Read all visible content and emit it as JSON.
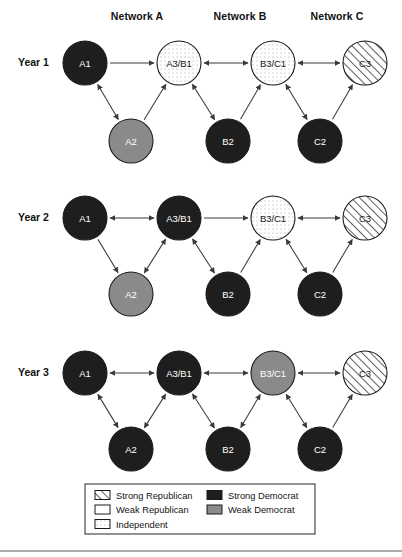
{
  "figure": {
    "network_labels": [
      {
        "text": "Network A",
        "x": 137,
        "y": 17
      },
      {
        "text": "Network B",
        "x": 240,
        "y": 17
      },
      {
        "text": "Network C",
        "x": 337,
        "y": 17
      }
    ],
    "year_labels": [
      {
        "text": "Year 1",
        "x": 18,
        "y": 63
      },
      {
        "text": "Year 2",
        "x": 18,
        "y": 218
      },
      {
        "text": "Year 3",
        "x": 18,
        "y": 373
      }
    ]
  },
  "legend": {
    "title": "",
    "box": {
      "x": 85,
      "y": 484,
      "width": 230,
      "height": 50
    },
    "items": [
      {
        "label": "Strong Republican",
        "fill": "hatch",
        "column": 0,
        "row": 0
      },
      {
        "label": "Weak Republican",
        "fill": "white",
        "column": 0,
        "row": 1
      },
      {
        "label": "Independent",
        "fill": "dotted",
        "column": 0,
        "row": 2
      },
      {
        "label": "Strong Democrat",
        "fill": "black",
        "column": 1,
        "row": 0
      },
      {
        "label": "Weak Democrat",
        "fill": "gray",
        "column": 1,
        "row": 1
      }
    ]
  },
  "colors": {
    "strong_democrat": "#1e1e1e",
    "weak_democrat": "#8a8a8a",
    "independent": "#ffffff",
    "weak_republican": "#ffffff",
    "strong_republican": "#ffffff",
    "edge": "#3a3a3a",
    "text": "#141414",
    "background": "#ffffff"
  },
  "chart_data": {
    "type": "diagram",
    "title": "",
    "rows": [
      {
        "year": "Year 1",
        "nodes": [
          {
            "id": "A1",
            "label": "A1",
            "x": 85,
            "y": 63,
            "r": 22,
            "state": "strong_democrat"
          },
          {
            "id": "A3/B1",
            "label": "A3/B1",
            "x": 179,
            "y": 63,
            "r": 22,
            "state": "independent"
          },
          {
            "id": "B3/C1",
            "label": "B3/C1",
            "x": 273,
            "y": 63,
            "r": 22,
            "state": "independent"
          },
          {
            "id": "C3",
            "label": "C3",
            "x": 365,
            "y": 63,
            "r": 22,
            "state": "strong_republican"
          },
          {
            "id": "A2",
            "label": "A2",
            "x": 131,
            "y": 141,
            "r": 22,
            "state": "weak_democrat"
          },
          {
            "id": "B2",
            "label": "B2",
            "x": 228,
            "y": 141,
            "r": 22,
            "state": "strong_democrat"
          },
          {
            "id": "C2",
            "label": "C2",
            "x": 320,
            "y": 141,
            "r": 22,
            "state": "strong_democrat"
          }
        ],
        "edges": [
          {
            "from": "A1",
            "to": "A3/B1",
            "dir": "forward"
          },
          {
            "from": "A3/B1",
            "to": "B3/C1",
            "dir": "both"
          },
          {
            "from": "B3/C1",
            "to": "C3",
            "dir": "both"
          },
          {
            "from": "A1",
            "to": "A2",
            "dir": "both"
          },
          {
            "from": "A2",
            "to": "A3/B1",
            "dir": "forward"
          },
          {
            "from": "A3/B1",
            "to": "B2",
            "dir": "both"
          },
          {
            "from": "B2",
            "to": "B3/C1",
            "dir": "forward"
          },
          {
            "from": "B3/C1",
            "to": "C2",
            "dir": "both"
          },
          {
            "from": "C2",
            "to": "C3",
            "dir": "forward"
          }
        ]
      },
      {
        "year": "Year 2",
        "nodes": [
          {
            "id": "A1",
            "label": "A1",
            "x": 85,
            "y": 218,
            "r": 22,
            "state": "strong_democrat"
          },
          {
            "id": "A3/B1",
            "label": "A3/B1",
            "x": 179,
            "y": 218,
            "r": 22,
            "state": "strong_democrat"
          },
          {
            "id": "B3/C1",
            "label": "B3/C1",
            "x": 273,
            "y": 218,
            "r": 22,
            "state": "independent"
          },
          {
            "id": "C3",
            "label": "C3",
            "x": 365,
            "y": 218,
            "r": 22,
            "state": "strong_republican"
          },
          {
            "id": "A2",
            "label": "A2",
            "x": 131,
            "y": 294,
            "r": 22,
            "state": "weak_democrat"
          },
          {
            "id": "B2",
            "label": "B2",
            "x": 228,
            "y": 294,
            "r": 22,
            "state": "strong_democrat"
          },
          {
            "id": "C2",
            "label": "C2",
            "x": 320,
            "y": 294,
            "r": 22,
            "state": "strong_democrat"
          }
        ],
        "edges": [
          {
            "from": "A1",
            "to": "A3/B1",
            "dir": "both"
          },
          {
            "from": "A3/B1",
            "to": "B3/C1",
            "dir": "forward"
          },
          {
            "from": "B3/C1",
            "to": "C3",
            "dir": "both"
          },
          {
            "from": "A1",
            "to": "A2",
            "dir": "forward"
          },
          {
            "from": "A3/B1",
            "to": "A2",
            "dir": "both"
          },
          {
            "from": "B2",
            "to": "A3/B1",
            "dir": "both"
          },
          {
            "from": "B2",
            "to": "B3/C1",
            "dir": "forward"
          },
          {
            "from": "B3/C1",
            "to": "C2",
            "dir": "both"
          },
          {
            "from": "C2",
            "to": "C3",
            "dir": "forward"
          }
        ]
      },
      {
        "year": "Year 3",
        "nodes": [
          {
            "id": "A1",
            "label": "A1",
            "x": 85,
            "y": 373,
            "r": 22,
            "state": "strong_democrat"
          },
          {
            "id": "A3/B1",
            "label": "A3/B1",
            "x": 179,
            "y": 373,
            "r": 22,
            "state": "strong_democrat"
          },
          {
            "id": "B3/C1",
            "label": "B3/C1",
            "x": 273,
            "y": 373,
            "r": 22,
            "state": "weak_democrat"
          },
          {
            "id": "C3",
            "label": "C3",
            "x": 365,
            "y": 373,
            "r": 22,
            "state": "strong_republican"
          },
          {
            "id": "A2",
            "label": "A2",
            "x": 131,
            "y": 449,
            "r": 22,
            "state": "strong_democrat"
          },
          {
            "id": "B2",
            "label": "B2",
            "x": 228,
            "y": 449,
            "r": 22,
            "state": "strong_democrat"
          },
          {
            "id": "C2",
            "label": "C2",
            "x": 320,
            "y": 449,
            "r": 22,
            "state": "strong_democrat"
          }
        ],
        "edges": [
          {
            "from": "A1",
            "to": "A3/B1",
            "dir": "both"
          },
          {
            "from": "A3/B1",
            "to": "B3/C1",
            "dir": "both"
          },
          {
            "from": "B3/C1",
            "to": "C3",
            "dir": "both"
          },
          {
            "from": "A1",
            "to": "A2",
            "dir": "both"
          },
          {
            "from": "A2",
            "to": "A3/B1",
            "dir": "both"
          },
          {
            "from": "A3/B1",
            "to": "B2",
            "dir": "both"
          },
          {
            "from": "B2",
            "to": "B3/C1",
            "dir": "both"
          },
          {
            "from": "B3/C1",
            "to": "C2",
            "dir": "both"
          },
          {
            "from": "C2",
            "to": "C3",
            "dir": "forward"
          }
        ]
      }
    ]
  }
}
